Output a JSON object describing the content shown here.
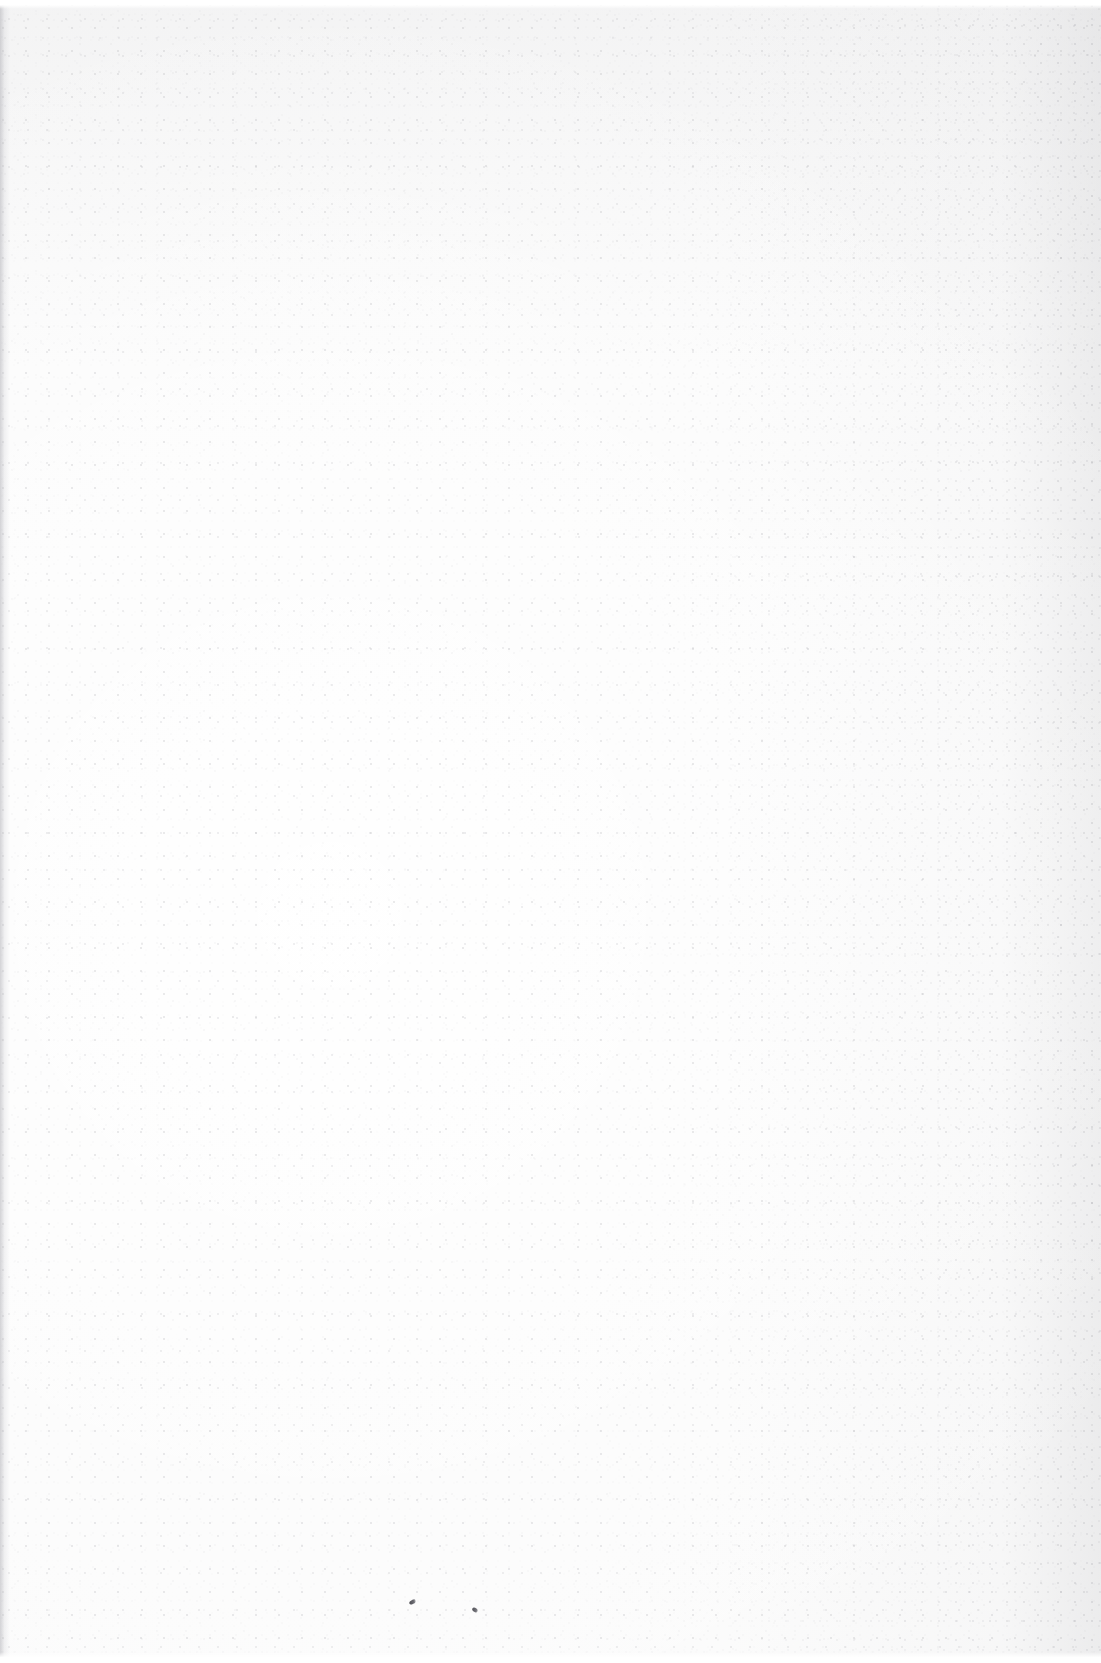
{
  "page": {
    "kind": "scanned-page",
    "content_state": "blank",
    "width_px": 1101,
    "height_px": 1663,
    "text_content": "",
    "visible_text_lines": [],
    "headings": [],
    "page_number": "",
    "paper_color": "#fbfbfb",
    "grain_color": "#8c8c94",
    "ink_speck_color": "#4e4e54"
  },
  "artifacts": {
    "label": "scan artifacts",
    "items": [
      {
        "name": "gutter-shadow",
        "edge": "left",
        "width_px": 10,
        "color": "#b0b0b6"
      },
      {
        "name": "scan-edge-top",
        "edge": "top",
        "height_px": 9,
        "color": "#ffffff"
      },
      {
        "name": "scan-edge-bottom",
        "edge": "bottom",
        "height_px": 11,
        "color": "#ffffff"
      },
      {
        "name": "ink-speck-left",
        "x_px": 413,
        "y_px": 1603,
        "color": "#4a4a50"
      },
      {
        "name": "ink-speck-right",
        "x_px": 476,
        "y_px": 1611,
        "color": "#4e4e54"
      }
    ]
  }
}
